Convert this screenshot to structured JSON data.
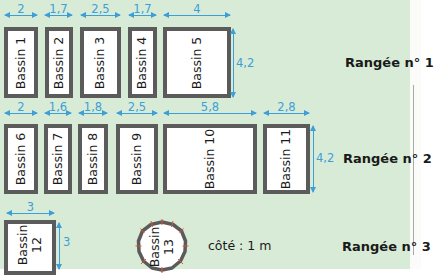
{
  "diagram": {
    "background_color": "#d8ebd6",
    "dimension_color": "#3d9fd8",
    "border_color": "#5b5b5b",
    "rows": [
      {
        "label": "Rangée n° 1",
        "height_dim": "4,2",
        "basins": [
          {
            "name": "Bassin 1",
            "width_dim": "2"
          },
          {
            "name": "Bassin 2",
            "width_dim": "1,7"
          },
          {
            "name": "Bassin 3",
            "width_dim": "2,5"
          },
          {
            "name": "Bassin 4",
            "width_dim": "1,7"
          },
          {
            "name": "Bassin 5",
            "width_dim": "4"
          }
        ]
      },
      {
        "label": "Rangée n° 2",
        "height_dim": "4,2",
        "basins": [
          {
            "name": "Bassin 6",
            "width_dim": "2"
          },
          {
            "name": "Bassin 7",
            "width_dim": "1,6"
          },
          {
            "name": "Bassin 8",
            "width_dim": "1,8"
          },
          {
            "name": "Bassin 9",
            "width_dim": "2,5"
          },
          {
            "name": "Bassin 10",
            "width_dim": "5,8"
          },
          {
            "name": "Bassin 11",
            "width_dim": "2,8"
          }
        ]
      },
      {
        "label": "Rangée n° 3",
        "basins": [
          {
            "name_line1": "Bassin",
            "name_line2": "12",
            "width_dim": "3",
            "height_dim": "3"
          },
          {
            "name_line1": "Bassin",
            "name_line2": "13",
            "shape": "regular polygon",
            "side_note": "côté : 1 m"
          }
        ]
      }
    ]
  }
}
